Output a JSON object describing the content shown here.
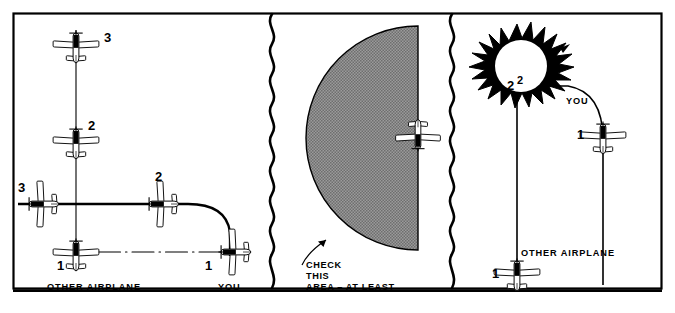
{
  "figure": {
    "frame": {
      "border_color": "#000000",
      "background": "#ffffff"
    },
    "shade_color": "#8c8c8c",
    "ink_color": "#000000",
    "panels": [
      {
        "id": "panel-converging-paths",
        "name": "converging-paths",
        "labels": {
          "other_airplane": "OTHER AIRPLANE",
          "you": "YOU",
          "positions_other": [
            "1",
            "2",
            "3"
          ],
          "positions_you": [
            "1",
            "2",
            "3"
          ]
        },
        "aircraft": [
          {
            "name": "other-airplane-pos-1",
            "label": "1",
            "heading": "north"
          },
          {
            "name": "other-airplane-pos-2",
            "label": "2",
            "heading": "north"
          },
          {
            "name": "other-airplane-pos-3",
            "label": "3",
            "heading": "north"
          },
          {
            "name": "your-airplane-pos-1",
            "label": "1",
            "heading": "west"
          },
          {
            "name": "your-airplane-pos-2",
            "label": "2",
            "heading": "west"
          },
          {
            "name": "your-airplane-pos-3",
            "label": "3",
            "heading": "west"
          }
        ]
      },
      {
        "id": "panel-scan-area",
        "name": "scan-area",
        "labels": {
          "callout_line_1": "CHECK",
          "callout_line_2": "THIS",
          "callout_line_3": "AREA – AT LEAST"
        },
        "aircraft": [
          {
            "name": "your-airplane-scan",
            "label": "",
            "heading": "south"
          }
        ]
      },
      {
        "id": "panel-collision",
        "name": "collision",
        "labels": {
          "other_airplane": "OTHER AIRPLANE",
          "you": "YOU",
          "collision_marker_left": "2",
          "collision_marker_right": "2",
          "position_other_1": "1",
          "position_you_1": "1"
        },
        "aircraft": [
          {
            "name": "other-airplane-pos-1",
            "label": "1",
            "heading": "north"
          },
          {
            "name": "your-airplane-pos-1",
            "label": "1",
            "heading": "north"
          }
        ],
        "burst": {
          "name": "collision-burst",
          "shape": "starburst"
        }
      }
    ],
    "dividers": [
      {
        "name": "wavy-divider-left",
        "x": 272
      },
      {
        "name": "wavy-divider-right",
        "x": 452
      }
    ]
  }
}
